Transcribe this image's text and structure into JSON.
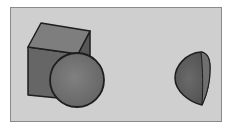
{
  "scene": {
    "description": "Grayscale 3D render of a cube with a sphere in front, and a half-sphere on the right",
    "colors": {
      "background": "#cfcfcf",
      "frame_border": "#8a8a8a",
      "cube_top": "#7d7d7d",
      "cube_front": "#6a6a6a",
      "cube_side": "#5a5a5a",
      "sphere": "#767676",
      "half_sphere": "#5f5f5f",
      "half_sphere_face": "#6e6e6e",
      "outline": "#1e1e1e"
    },
    "objects": [
      {
        "type": "cube"
      },
      {
        "type": "sphere"
      },
      {
        "type": "half-sphere"
      }
    ]
  }
}
